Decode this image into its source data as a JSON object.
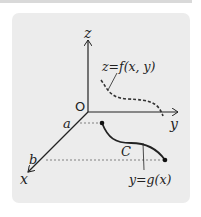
{
  "diagram": {
    "axes": {
      "z": "z",
      "y": "y",
      "x": "x",
      "origin": "O"
    },
    "x_ticks": [
      "a",
      "b"
    ],
    "surface_label": "z=f(x, y)",
    "curve_label": "C",
    "projection_label": "y=g(x)",
    "colors": {
      "panel": "#ececec",
      "ink": "#222222",
      "dash": "#333333"
    }
  }
}
